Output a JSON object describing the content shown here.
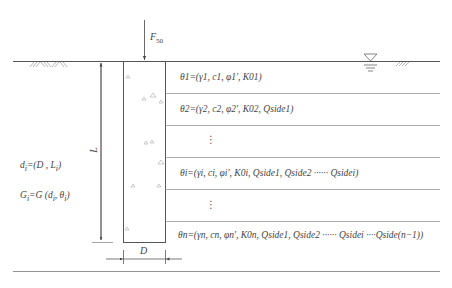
{
  "diagram": {
    "type": "pile-in-layered-soil",
    "load": {
      "label": "F",
      "subscript": "50"
    },
    "pile": {
      "length_label": "L",
      "diameter_label": "D"
    },
    "left_equations": [
      {
        "text": "d",
        "sub": "i",
        "rest": "=(D , L",
        "sub2": "i",
        "end": ")"
      },
      {
        "text": "G",
        "sub": "i",
        "rest": "=G (d",
        "sub2": "i",
        "mid": ", θ",
        "sub3": "i",
        "end": ")"
      }
    ],
    "layers": [
      {
        "label": "θ1=(γ1, c1, φ1′, K01)"
      },
      {
        "label": "θ2=(γ2, c2, φ2′, K02, Qside1)"
      },
      {
        "label": "⋮"
      },
      {
        "label": "θi=(γi, ci, φi′, K0i, Qside1, Qside2 ······ Qsidei)"
      },
      {
        "label": "⋮"
      },
      {
        "label": "θn=(γn, cn, φn′, K0n, Qside1, Qside2 ······ Qsidei ····Qside(n−1))"
      }
    ],
    "symbols": {
      "ground_hatch_left": "ground-surface-hatch",
      "ground_hatch_right": "ground-surface-hatch",
      "water_table": "water-table-triangle"
    },
    "colors": {
      "line": "#555555",
      "light_line": "#9a9a9a",
      "text": "#444444"
    }
  }
}
